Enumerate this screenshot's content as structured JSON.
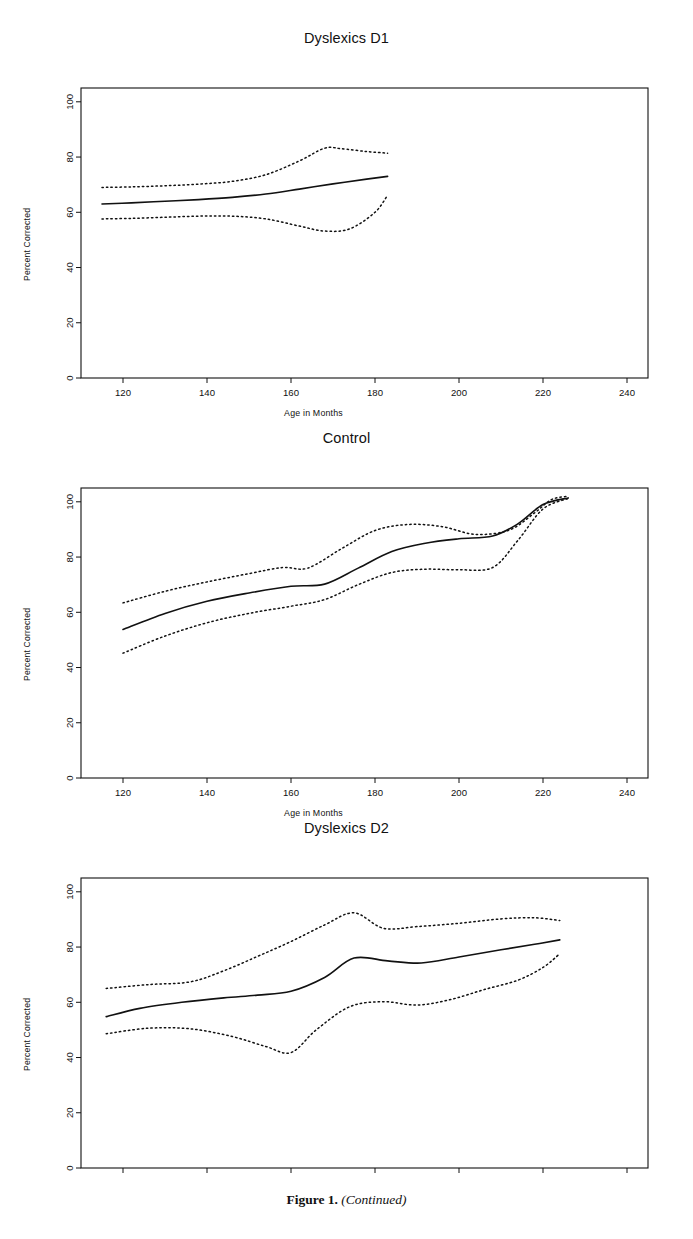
{
  "figure": {
    "caption_bold": "Figure 1.",
    "caption_italic": "(Continued)"
  },
  "axis": {
    "ylabel": "Percent Corrected",
    "xlabel": "Age in Months",
    "yticks": [
      0,
      20,
      40,
      60,
      80,
      100
    ],
    "xticks": [
      120,
      140,
      160,
      180,
      200,
      220,
      240
    ]
  },
  "chart_data": [
    {
      "type": "line",
      "title": "Dyslexics D1",
      "xlabel": "Age in Months",
      "ylabel": "Percent Corrected",
      "xlim": [
        110,
        245
      ],
      "ylim": [
        0,
        105
      ],
      "xticks": [
        120,
        140,
        160,
        180,
        200,
        220,
        240
      ],
      "yticks": [
        0,
        20,
        40,
        60,
        80,
        100
      ],
      "grid": false,
      "legend": "none",
      "series": [
        {
          "name": "fit",
          "style": "solid",
          "x": [
            115,
            122,
            130,
            138,
            146,
            154,
            162,
            170,
            178,
            183
          ],
          "values": [
            63.0,
            63.4,
            64.0,
            64.6,
            65.4,
            66.6,
            68.4,
            70.3,
            72.0,
            73.0
          ]
        },
        {
          "name": "upper-confidence-band",
          "style": "dotted",
          "x": [
            115,
            122,
            130,
            138,
            146,
            154,
            162,
            168,
            172,
            178,
            183
          ],
          "values": [
            69.0,
            69.2,
            69.6,
            70.2,
            71.2,
            73.6,
            78.6,
            83.2,
            83.0,
            82.0,
            81.4
          ]
        },
        {
          "name": "lower-confidence-band",
          "style": "dotted",
          "x": [
            115,
            122,
            130,
            138,
            146,
            154,
            162,
            168,
            174,
            180,
            183
          ],
          "values": [
            57.6,
            57.8,
            58.2,
            58.6,
            58.6,
            57.6,
            55.0,
            53.2,
            54.0,
            60.0,
            66.2
          ]
        }
      ]
    },
    {
      "type": "line",
      "title": "Control",
      "xlabel": "Age in Months",
      "ylabel": "Percent Corrected",
      "xlim": [
        110,
        245
      ],
      "ylim": [
        0,
        105
      ],
      "xticks": [
        120,
        140,
        160,
        180,
        200,
        220,
        240
      ],
      "yticks": [
        0,
        20,
        40,
        60,
        80,
        100
      ],
      "grid": false,
      "legend": "none",
      "series": [
        {
          "name": "fit",
          "style": "solid",
          "x": [
            120,
            130,
            140,
            150,
            160,
            168,
            176,
            184,
            192,
            200,
            208,
            214,
            220,
            226
          ],
          "values": [
            53.8,
            59.6,
            64.0,
            67.0,
            69.4,
            70.2,
            76.0,
            82.0,
            85.0,
            86.6,
            87.6,
            92.0,
            99.0,
            101.4
          ]
        },
        {
          "name": "upper-confidence-band",
          "style": "dotted",
          "x": [
            120,
            130,
            140,
            150,
            158,
            164,
            172,
            180,
            188,
            196,
            204,
            212,
            218,
            222,
            226
          ],
          "values": [
            63.4,
            67.6,
            71.0,
            74.0,
            76.2,
            76.0,
            83.0,
            89.6,
            91.8,
            91.0,
            88.2,
            89.8,
            96.0,
            100.8,
            102.0
          ]
        },
        {
          "name": "lower-confidence-band",
          "style": "dotted",
          "x": [
            120,
            130,
            140,
            150,
            160,
            168,
            176,
            184,
            192,
            200,
            208,
            214,
            220,
            226
          ],
          "values": [
            45.2,
            51.4,
            56.2,
            59.6,
            62.2,
            64.6,
            70.0,
            74.4,
            75.6,
            75.4,
            76.2,
            86.0,
            97.4,
            101.2
          ]
        }
      ]
    },
    {
      "type": "line",
      "title": "Dyslexics D2",
      "xlabel": "",
      "ylabel": "Percent Corrected",
      "xlim": [
        110,
        245
      ],
      "ylim": [
        0,
        105
      ],
      "xticks": [
        120,
        140,
        160,
        180,
        200,
        220,
        240
      ],
      "yticks": [
        0,
        20,
        40,
        60,
        80,
        100
      ],
      "grid": false,
      "legend": "none",
      "series": [
        {
          "name": "fit",
          "style": "solid",
          "x": [
            116,
            124,
            134,
            144,
            152,
            160,
            168,
            175,
            183,
            191,
            200,
            210,
            218,
            224
          ],
          "values": [
            54.8,
            57.8,
            60.0,
            61.6,
            62.6,
            64.0,
            69.0,
            76.0,
            75.0,
            74.2,
            76.4,
            79.0,
            81.0,
            82.6
          ]
        },
        {
          "name": "upper-confidence-band",
          "style": "dotted",
          "x": [
            116,
            126,
            136,
            144,
            152,
            160,
            168,
            175,
            182,
            190,
            200,
            210,
            218,
            224
          ],
          "values": [
            65.0,
            66.4,
            67.4,
            71.4,
            76.6,
            82.0,
            88.0,
            92.4,
            86.8,
            87.4,
            88.6,
            90.2,
            90.6,
            89.6
          ]
        },
        {
          "name": "lower-confidence-band",
          "style": "dotted",
          "x": [
            116,
            126,
            136,
            146,
            154,
            160,
            166,
            174,
            182,
            190,
            198,
            206,
            214,
            220,
            224
          ],
          "values": [
            48.6,
            50.6,
            50.4,
            47.6,
            44.0,
            41.8,
            50.0,
            58.4,
            60.2,
            59.0,
            61.0,
            64.6,
            68.0,
            72.6,
            77.6
          ]
        }
      ]
    }
  ]
}
